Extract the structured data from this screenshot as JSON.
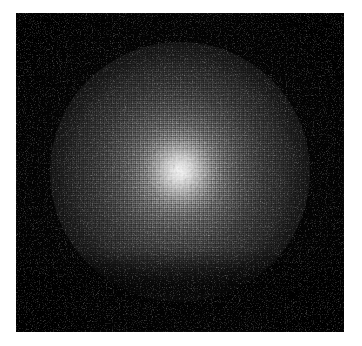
{
  "canvas": {
    "width": 362,
    "height": 346,
    "background_color": "#ffffff"
  },
  "image_panel": {
    "label": "rendered-sphere",
    "x": 16,
    "y": 13,
    "width": 328,
    "height": 319,
    "background_color": "#030303",
    "rim_color": "#151515"
  },
  "render": {
    "subject": "illuminated sphere",
    "style": "dithered grayscale raytrace",
    "sphere": {
      "center_x": 164,
      "center_y": 159,
      "radius": 130,
      "highlight_color": "#f2f2f2",
      "midtone_color": "#565656",
      "shadow_color": "#0c0c0c"
    },
    "specular": {
      "center_x": 164,
      "center_y": 157,
      "radius": 46,
      "color": "#ffffff",
      "intensity": "0.62"
    },
    "ambient_glow": {
      "radius": 190,
      "color": "#969696"
    },
    "terminator_band": {
      "position": "lower",
      "start_pct": 74,
      "peak_pct": 86,
      "color": "#000000"
    },
    "vignette": {
      "color": "#000000",
      "start_pct": 52,
      "full_pct": 100
    },
    "dither": {
      "type": "ordered checkerboard",
      "fine_cell_px": 1,
      "coarse_cell_px": 2,
      "light_color": "#ffffff",
      "dark_color": "#000000"
    },
    "noise": {
      "bright_speckle_opacity": "0.55",
      "dark_speckle_opacity": "0.45",
      "frequency_fine": "0.85",
      "frequency_coarse": "0.35"
    }
  }
}
